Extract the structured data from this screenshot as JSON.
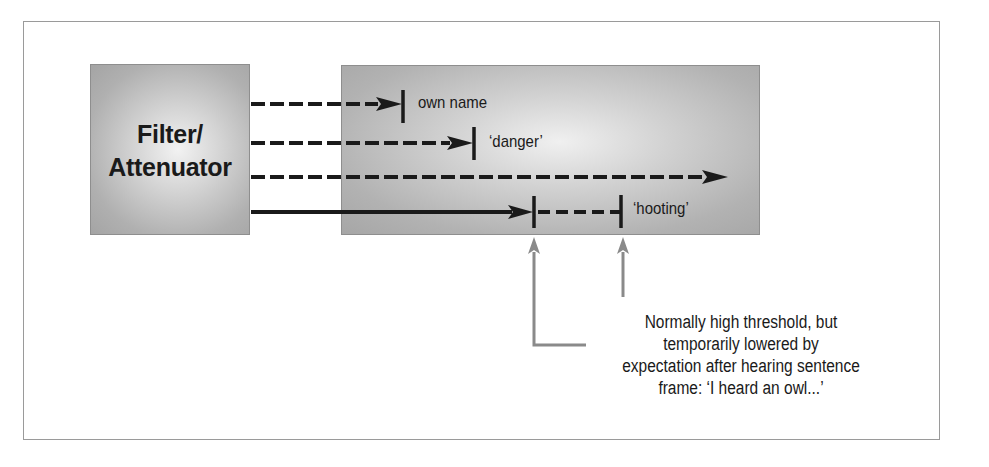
{
  "diagram": {
    "filter_box": {
      "label_line1": "Filter/",
      "label_line2": "Attenuator"
    },
    "channels": [
      {
        "style": "dashed",
        "threshold_label": "own name",
        "threshold": "low"
      },
      {
        "style": "dashed",
        "threshold_label": "‘danger’",
        "threshold": "low"
      },
      {
        "style": "dashed",
        "threshold_label": "",
        "threshold": "none"
      },
      {
        "style": "solid-then-dashed",
        "threshold_label": "‘hooting’",
        "threshold": "normally high, temporarily lowered"
      }
    ],
    "annotation": {
      "lines": [
        "Normally high threshold, but",
        "temporarily lowered by",
        "expectation after hearing sentence",
        "frame: ‘I heard an owl...’"
      ]
    },
    "colors": {
      "arrow": "#1a1a1a",
      "pointer": "#8a8a8a",
      "box_edge": "#a6a6a6",
      "box_center": "#f0f0f0",
      "frame": "#9a9a9a"
    }
  }
}
